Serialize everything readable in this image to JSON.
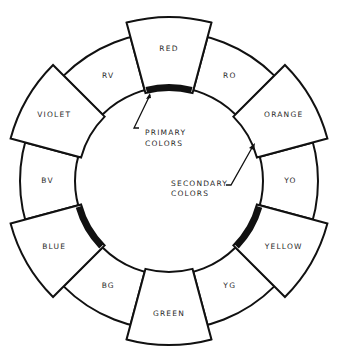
{
  "diagram": {
    "type": "color-wheel",
    "colors": {
      "line": "#111111",
      "background": "#ffffff",
      "text": "#2a2a2a"
    },
    "segments": [
      {
        "label": "RED",
        "kind": "primary",
        "angle": -90
      },
      {
        "label": "RO",
        "kind": "tertiary",
        "angle": -60
      },
      {
        "label": "ORANGE",
        "kind": "secondary",
        "angle": -30
      },
      {
        "label": "YO",
        "kind": "tertiary",
        "angle": 0
      },
      {
        "label": "YELLOW",
        "kind": "primary",
        "angle": 30
      },
      {
        "label": "YG",
        "kind": "tertiary",
        "angle": 60
      },
      {
        "label": "GREEN",
        "kind": "secondary",
        "angle": 90
      },
      {
        "label": "BG",
        "kind": "tertiary",
        "angle": 120
      },
      {
        "label": "BLUE",
        "kind": "primary",
        "angle": 150
      },
      {
        "label": "BV",
        "kind": "tertiary",
        "angle": 180
      },
      {
        "label": "VIOLET",
        "kind": "secondary",
        "angle": 210
      },
      {
        "label": "RV",
        "kind": "tertiary",
        "angle": 240
      }
    ],
    "callouts": {
      "primary": {
        "line1": "PRIMARY",
        "line2": "COLORS"
      },
      "secondary": {
        "line1": "SECONDARY",
        "line2": "COLORS"
      }
    }
  }
}
